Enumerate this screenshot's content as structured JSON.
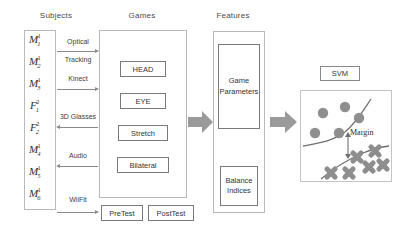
{
  "diagram": {
    "columns": [
      {
        "label": "Subjects"
      },
      {
        "label": "Games"
      },
      {
        "label": "Features"
      }
    ],
    "subjects": [
      {
        "base": "M",
        "sub": "1",
        "sup": "1"
      },
      {
        "base": "M",
        "sub": "2",
        "sup": "1"
      },
      {
        "base": "M",
        "sub": "3",
        "sup": "1"
      },
      {
        "base": "F",
        "sub": "1",
        "sup": "2"
      },
      {
        "base": "F",
        "sub": "2",
        "sup": "2"
      },
      {
        "base": "M",
        "sub": "4",
        "sup": "1"
      },
      {
        "base": "M",
        "sub": "5",
        "sup": "1"
      },
      {
        "base": "M",
        "sub": "6",
        "sup": "1"
      }
    ],
    "connectors": [
      {
        "label_line1": "Optical",
        "label_line2": "Tracking",
        "direction": "right"
      },
      {
        "label_line1": "Kinect",
        "label_line2": "",
        "direction": "right"
      },
      {
        "label_line1": "3D Glasses",
        "label_line2": "",
        "direction": "left"
      },
      {
        "label_line1": "Audio",
        "label_line2": "",
        "direction": "left"
      },
      {
        "label_line1": "WiiFit",
        "label_line2": "",
        "direction": "right"
      }
    ],
    "games": [
      {
        "label": "HEAD"
      },
      {
        "label": "EYE"
      },
      {
        "label": "Stretch"
      },
      {
        "label": "Bilateral"
      }
    ],
    "tests": [
      {
        "label": "PreTest"
      },
      {
        "label": "PostTest"
      }
    ],
    "features": [
      {
        "label_line1": "Game",
        "label_line2": "Parameters"
      },
      {
        "label_line1": "Balance",
        "label_line2": "Indices"
      }
    ],
    "classifier": {
      "label": "SVM",
      "margin_label": "Margin",
      "circle_points": [
        {
          "cx": 22,
          "cy": 22
        },
        {
          "cx": 44,
          "cy": 16
        },
        {
          "cx": 58,
          "cy": 27
        },
        {
          "cx": 16,
          "cy": 41
        },
        {
          "cx": 41,
          "cy": 40
        },
        {
          "cx": 61,
          "cy": 10
        }
      ],
      "cross_points": [
        {
          "cx": 56,
          "cy": 68
        },
        {
          "cx": 74,
          "cy": 62
        },
        {
          "cx": 69,
          "cy": 78
        },
        {
          "cx": 50,
          "cy": 83
        },
        {
          "cx": 84,
          "cy": 76
        },
        {
          "cx": 32,
          "cy": 80
        }
      ],
      "colors": {
        "point_fill": "#8e8e8e",
        "boundary": "#6f6f6f",
        "arrow_grey": "#8a8a8a",
        "block_arrow": "#9a9a9a"
      }
    }
  }
}
